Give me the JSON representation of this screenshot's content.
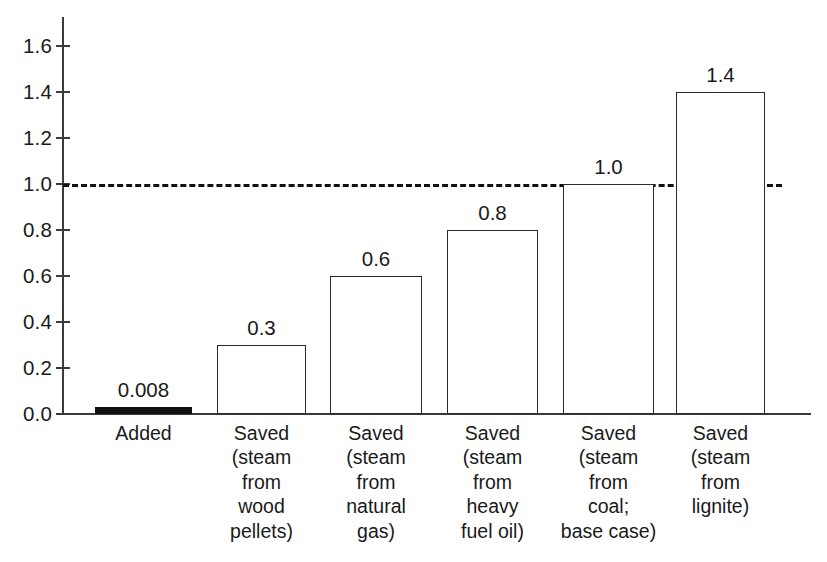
{
  "chart_data": {
    "type": "bar",
    "title": "",
    "subtitle": "",
    "xlabel": "",
    "ylabel": "",
    "ylim": [
      0.0,
      1.7
    ],
    "grid": false,
    "legend": "none",
    "categories": [
      "Added",
      "Saved (steam from wood pellets)",
      "Saved (steam from natural gas)",
      "Saved (steam from heavy fuel oil)",
      "Saved (steam from coal; base case)",
      "Saved (steam from lignite)"
    ],
    "category_lines": [
      [
        "Added"
      ],
      [
        "Saved",
        "(steam",
        "from",
        "wood",
        "pellets)"
      ],
      [
        "Saved",
        "(steam",
        "from",
        "natural",
        "gas)"
      ],
      [
        "Saved",
        "(steam",
        "from",
        "heavy",
        "fuel oil)"
      ],
      [
        "Saved",
        "(steam",
        "from",
        "coal;",
        "base case)"
      ],
      [
        "Saved",
        "(steam",
        "from",
        "lignite)"
      ]
    ],
    "values": [
      0.008,
      0.3,
      0.6,
      0.8,
      1.0,
      1.4
    ],
    "value_labels": [
      "0.008",
      "0.3",
      "0.6",
      "0.8",
      "1.0",
      "1.4"
    ],
    "bar_styles": [
      "filled",
      "outline",
      "outline",
      "outline",
      "outline",
      "outline"
    ],
    "y_ticks": [
      0.0,
      0.2,
      0.4,
      0.6,
      0.8,
      1.0,
      1.2,
      1.4,
      1.6
    ],
    "y_tick_labels": [
      "0.0",
      "0.2",
      "0.4",
      "0.6",
      "0.8",
      "1.0",
      "1.2",
      "1.4",
      "1.6"
    ],
    "annotations": [
      {
        "name": "reference-line",
        "type": "hline",
        "value": 1.0,
        "style": "dashed",
        "color": "#111111"
      }
    ],
    "colors": {
      "bar_fill": "#111111",
      "bar_outline": "#2b2b2b",
      "axis": "#3a3a3a",
      "text": "#1a1a1a",
      "background": "#ffffff",
      "reference_line": "#111111"
    }
  }
}
